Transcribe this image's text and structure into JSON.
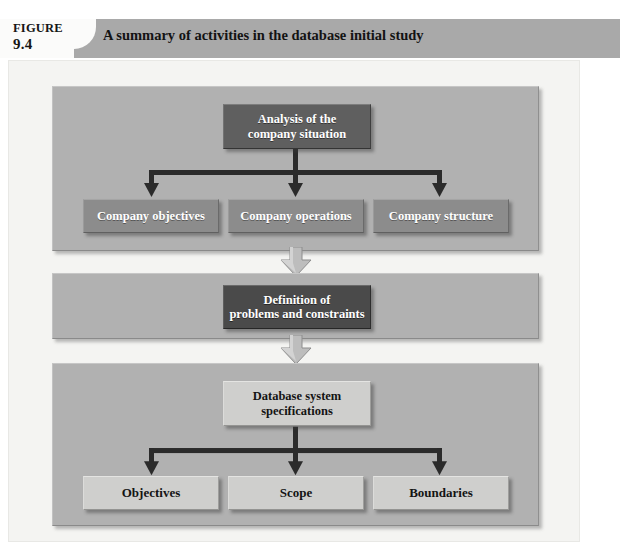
{
  "header": {
    "figure_word": "FIGURE",
    "figure_number": "9.4",
    "title": "A summary of activities in the database initial study",
    "bar_color": "#a9a9a9",
    "notch_color": "#fbfbfa"
  },
  "diagram": {
    "background_color": "#f4f4f2",
    "panel_color": "#b1b1b1",
    "connector_color": "#2b2b2b",
    "arrow_fill": "#bdbdbd",
    "panels": [
      {
        "name": "analysis",
        "root": {
          "label": "Analysis of the\ncompany situation",
          "style": "dark"
        },
        "children": [
          {
            "label": "Company objectives",
            "style": "mid"
          },
          {
            "label": "Company operations",
            "style": "mid"
          },
          {
            "label": "Company structure",
            "style": "mid"
          }
        ]
      },
      {
        "name": "definition",
        "root": {
          "label": "Definition of\nproblems and constraints",
          "style": "darkest"
        },
        "children": []
      },
      {
        "name": "specifications",
        "root": {
          "label": "Database system\nspecifications",
          "style": "light"
        },
        "children": [
          {
            "label": "Objectives",
            "style": "light"
          },
          {
            "label": "Scope",
            "style": "light"
          },
          {
            "label": "Boundaries",
            "style": "light"
          }
        ]
      }
    ],
    "flow_arrows": [
      {
        "name": "analysis-to-definition",
        "direction": "down"
      },
      {
        "name": "definition-to-specifications",
        "direction": "down"
      }
    ]
  }
}
